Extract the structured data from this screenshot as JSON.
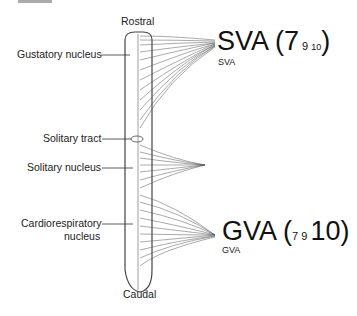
{
  "diagram": {
    "orientation": {
      "top": "Rostral",
      "bottom": "Caudal"
    },
    "left_labels": [
      {
        "text": "Gustatory nucleus"
      },
      {
        "text": "Solitary tract"
      },
      {
        "text": "Solitary nucleus"
      },
      {
        "text": "Cardiorespiratory",
        "text2": "nucleus"
      }
    ],
    "sva": {
      "big": "SVA (7",
      "sub1": "9",
      "sub2": "10",
      "close": ")",
      "small": "SVA"
    },
    "gva": {
      "big": "GVA (",
      "sub1": "7",
      "sub2": "9",
      "mid": "10)",
      "small": "GVA"
    }
  }
}
